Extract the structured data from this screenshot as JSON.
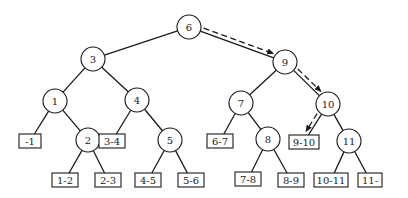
{
  "diagram": {
    "type": "binary-search-tree",
    "style": {
      "stroke_color": "#1a1a1a",
      "background": "#ffffff",
      "node_radius": 12
    },
    "internal_nodes": [
      {
        "id": "n6",
        "label": "6",
        "x": 189,
        "y": 27
      },
      {
        "id": "n3",
        "label": "3",
        "x": 93,
        "y": 59
      },
      {
        "id": "n9",
        "label": "9",
        "x": 285,
        "y": 62
      },
      {
        "id": "n1",
        "label": "1",
        "x": 55,
        "y": 101
      },
      {
        "id": "n4",
        "label": "4",
        "x": 137,
        "y": 100
      },
      {
        "id": "n7",
        "label": "7",
        "x": 241,
        "y": 103
      },
      {
        "id": "n10",
        "label": "10",
        "x": 328,
        "y": 104
      },
      {
        "id": "n2",
        "label": "2",
        "x": 88,
        "y": 140
      },
      {
        "id": "n5",
        "label": "5",
        "x": 170,
        "y": 140
      },
      {
        "id": "n8",
        "label": "8",
        "x": 268,
        "y": 139
      },
      {
        "id": "n11",
        "label": "11",
        "x": 349,
        "y": 141
      }
    ],
    "leaf_nodes": [
      {
        "id": "l_-1",
        "label": "-1",
        "x": 30,
        "y": 141,
        "w": 22
      },
      {
        "id": "l_3-4",
        "label": "3-4",
        "x": 112,
        "y": 141,
        "w": 26
      },
      {
        "id": "l_6-7",
        "label": "6-7",
        "x": 220,
        "y": 141,
        "w": 26
      },
      {
        "id": "l_9-10",
        "label": "9-10",
        "x": 304,
        "y": 142,
        "w": 30
      },
      {
        "id": "l_1-2",
        "label": "1-2",
        "x": 65,
        "y": 180,
        "w": 26
      },
      {
        "id": "l_2-3",
        "label": "2-3",
        "x": 108,
        "y": 180,
        "w": 26
      },
      {
        "id": "l_4-5",
        "label": "4-5",
        "x": 148,
        "y": 180,
        "w": 26
      },
      {
        "id": "l_5-6",
        "label": "5-6",
        "x": 191,
        "y": 180,
        "w": 26
      },
      {
        "id": "l_7-8",
        "label": "7-8",
        "x": 248,
        "y": 179,
        "w": 26
      },
      {
        "id": "l_8-9",
        "label": "8-9",
        "x": 291,
        "y": 180,
        "w": 26
      },
      {
        "id": "l_10-11",
        "label": "10-11",
        "x": 331,
        "y": 180,
        "w": 34
      },
      {
        "id": "l_11-",
        "label": "11-",
        "x": 370,
        "y": 180,
        "w": 24
      }
    ],
    "edges": [
      [
        "n6",
        "n3"
      ],
      [
        "n6",
        "n9"
      ],
      [
        "n3",
        "n1"
      ],
      [
        "n3",
        "n4"
      ],
      [
        "n9",
        "n7"
      ],
      [
        "n9",
        "n10"
      ],
      [
        "n1",
        "l_-1"
      ],
      [
        "n1",
        "n2"
      ],
      [
        "n4",
        "l_3-4"
      ],
      [
        "n4",
        "n5"
      ],
      [
        "n7",
        "l_6-7"
      ],
      [
        "n7",
        "n8"
      ],
      [
        "n10",
        "l_9-10"
      ],
      [
        "n10",
        "n11"
      ],
      [
        "n2",
        "l_1-2"
      ],
      [
        "n2",
        "l_2-3"
      ],
      [
        "n5",
        "l_4-5"
      ],
      [
        "n5",
        "l_5-6"
      ],
      [
        "n8",
        "l_7-8"
      ],
      [
        "n8",
        "l_8-9"
      ],
      [
        "n11",
        "l_10-11"
      ],
      [
        "n11",
        "l_11-"
      ]
    ],
    "search_path": {
      "description": "dashed arrows tracing search path",
      "steps": [
        [
          "n6",
          "n9"
        ],
        [
          "n9",
          "n10"
        ],
        [
          "n10",
          "l_9-10"
        ]
      ]
    }
  }
}
